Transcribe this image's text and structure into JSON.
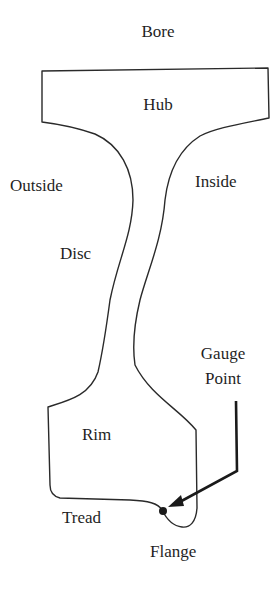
{
  "diagram": {
    "type": "cross-section",
    "labels": {
      "bore": "Bore",
      "hub": "Hub",
      "outside": "Outside",
      "inside": "Inside",
      "disc": "Disc",
      "gauge_point_line1": "Gauge",
      "gauge_point_line2": "Point",
      "rim": "Rim",
      "tread": "Tread",
      "flange": "Flange"
    },
    "colors": {
      "outline": "#2a2a2a",
      "text": "#1f1f1f",
      "background": "#ffffff"
    }
  }
}
